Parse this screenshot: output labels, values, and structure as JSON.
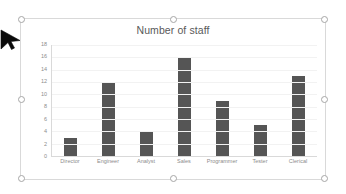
{
  "cursor": {
    "icon": "arrow-pointer-icon"
  },
  "chart_object": {
    "selected": true,
    "handles": [
      "top-left",
      "top-center",
      "top-right",
      "middle-left",
      "middle-right",
      "bottom-left",
      "bottom-center",
      "bottom-right"
    ]
  },
  "chart_data": {
    "type": "bar",
    "title": "Number of staff",
    "xlabel": "",
    "ylabel": "",
    "categories": [
      "Director",
      "Engineer",
      "Analyst",
      "Sales",
      "Programmer",
      "Tester",
      "Clerical"
    ],
    "values": [
      3,
      12,
      4,
      16,
      9,
      5,
      13
    ],
    "yticks": [
      0,
      2,
      4,
      6,
      8,
      10,
      12,
      14,
      16,
      18
    ],
    "ylim": [
      0,
      18
    ],
    "grid": true,
    "legend": false,
    "legend_position": "none",
    "series_color": "#555555",
    "gridline_color": "#F2F2F2",
    "axis_color": "#D9D9D9",
    "text_color": "#8C8C8C",
    "title_color": "#595959"
  }
}
